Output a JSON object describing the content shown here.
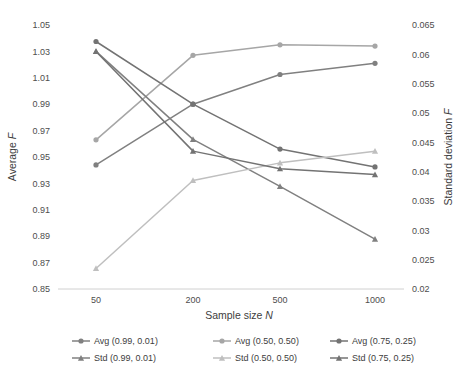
{
  "chart_data": {
    "type": "line",
    "title": "",
    "xlabel": "Sample size N",
    "ylabel": "Average F",
    "y2label": "Standard deviation F",
    "categories": [
      "50",
      "200",
      "500",
      "1000"
    ],
    "ylim": [
      0.85,
      1.05
    ],
    "ytick_step": 0.02,
    "yticks": [
      "0.85",
      "0.87",
      "0.89",
      "0.91",
      "0.93",
      "0.95",
      "0.97",
      "0.99",
      "1.01",
      "1.03",
      "1.05"
    ],
    "y2lim": [
      0.02,
      0.065
    ],
    "y2tick_step": 0.005,
    "y2ticks": [
      "0.02",
      "0.025",
      "0.03",
      "0.035",
      "0.04",
      "0.045",
      "0.05",
      "0.055",
      "0.06",
      "0.065"
    ],
    "grid": false,
    "legend_position": "bottom",
    "series": [
      {
        "name": "Avg (0.99, 0.01)",
        "axis": "left",
        "marker": "circle",
        "color": "#808080",
        "values": [
          0.944,
          0.99,
          1.0125,
          1.021
        ]
      },
      {
        "name": "Avg (0.50, 0.50)",
        "axis": "left",
        "marker": "circle",
        "color": "#a6a6a6",
        "values": [
          0.963,
          1.027,
          1.035,
          1.034
        ]
      },
      {
        "name": "Avg (0.75, 0.25)",
        "axis": "left",
        "marker": "circle",
        "color": "#737373",
        "values": [
          1.0375,
          0.99,
          0.956,
          0.9425
        ]
      },
      {
        "name": "Std (0.99, 0.01)",
        "axis": "right",
        "marker": "triangle",
        "color": "#808080",
        "values": [
          0.0605,
          0.0455,
          0.0375,
          0.0285
        ]
      },
      {
        "name": "Std (0.50, 0.50)",
        "axis": "right",
        "marker": "triangle",
        "color": "#bfbfbf",
        "values": [
          0.0235,
          0.0385,
          0.0415,
          0.0435
        ]
      },
      {
        "name": "Std (0.75, 0.25)",
        "axis": "right",
        "marker": "triangle",
        "color": "#737373",
        "values": [
          0.0605,
          0.0435,
          0.0405,
          0.0395
        ]
      }
    ],
    "legend": [
      {
        "label": "Avg (0.99, 0.01)",
        "color": "#808080",
        "marker": "circle"
      },
      {
        "label": "Avg (0.50, 0.50)",
        "color": "#a6a6a6",
        "marker": "circle"
      },
      {
        "label": "Avg (0.75, 0.25)",
        "color": "#737373",
        "marker": "circle"
      },
      {
        "label": "Std (0.99, 0.01)",
        "color": "#808080",
        "marker": "triangle"
      },
      {
        "label": "Std (0.50, 0.50)",
        "color": "#bfbfbf",
        "marker": "triangle"
      },
      {
        "label": "Std (0.75, 0.25)",
        "color": "#737373",
        "marker": "triangle"
      }
    ]
  }
}
